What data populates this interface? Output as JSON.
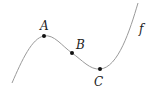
{
  "diagram": {
    "curve_label": "f",
    "points": [
      {
        "label": "A",
        "x": 44,
        "y": 36
      },
      {
        "label": "B",
        "x": 72,
        "y": 53
      },
      {
        "label": "C",
        "x": 100,
        "y": 69
      }
    ],
    "colors": {
      "curve": "#9a9a9a",
      "point": "#111111",
      "label": "#222222"
    }
  }
}
